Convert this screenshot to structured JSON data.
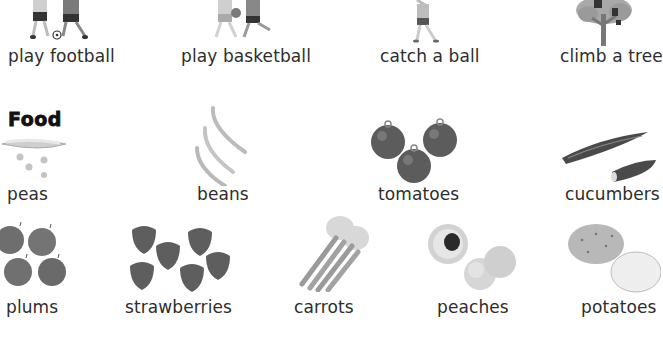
{
  "activities": [
    {
      "label": "play football",
      "icon": "children-playing-football-icon"
    },
    {
      "label": "play basketball",
      "icon": "children-playing-basketball-icon"
    },
    {
      "label": "catch a ball",
      "icon": "child-catching-ball-icon"
    },
    {
      "label": "climb a tree",
      "icon": "child-climbing-tree-icon"
    }
  ],
  "food_section": {
    "heading": "Food",
    "items_row1": [
      {
        "label": "peas",
        "icon": "peas-pod-icon"
      },
      {
        "label": "beans",
        "icon": "green-beans-icon"
      },
      {
        "label": "tomatoes",
        "icon": "tomatoes-icon"
      },
      {
        "label": "cucumbers",
        "icon": "cucumbers-icon"
      }
    ],
    "items_row2": [
      {
        "label": "plums",
        "icon": "plums-icon"
      },
      {
        "label": "strawberries",
        "icon": "strawberries-icon"
      },
      {
        "label": "carrots",
        "icon": "carrots-icon"
      },
      {
        "label": "peaches",
        "icon": "peaches-icon"
      },
      {
        "label": "potatoes",
        "icon": "potatoes-icon"
      }
    ]
  }
}
